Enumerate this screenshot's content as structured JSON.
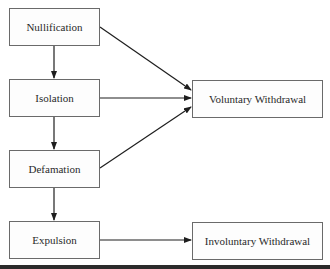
{
  "diagram": {
    "nodes": [
      {
        "id": "nullification",
        "label": "Nullification"
      },
      {
        "id": "isolation",
        "label": "Isolation"
      },
      {
        "id": "defamation",
        "label": "Defamation"
      },
      {
        "id": "expulsion",
        "label": "Expulsion"
      },
      {
        "id": "voluntary",
        "label": "Voluntary Withdrawal"
      },
      {
        "id": "involuntary",
        "label": "Involuntary Withdrawal"
      }
    ],
    "edges": [
      {
        "from": "nullification",
        "to": "isolation"
      },
      {
        "from": "isolation",
        "to": "defamation"
      },
      {
        "from": "defamation",
        "to": "expulsion"
      },
      {
        "from": "nullification",
        "to": "voluntary"
      },
      {
        "from": "isolation",
        "to": "voluntary"
      },
      {
        "from": "defamation",
        "to": "voluntary"
      },
      {
        "from": "expulsion",
        "to": "involuntary"
      }
    ],
    "colors": {
      "line": "#1e1e1e",
      "box_border": "#6a6a6a",
      "text": "#2a2a2a"
    }
  }
}
